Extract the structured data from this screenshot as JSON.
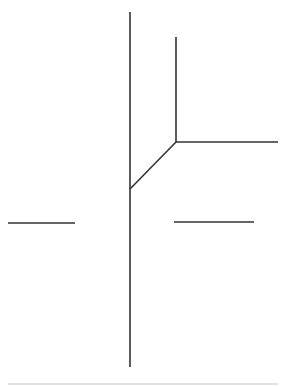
{
  "diagram": {
    "stroke_color": "#333333",
    "baseline_color": "#d8d8d8",
    "segments": [
      {
        "name": "main-vertical-line",
        "x1": 130,
        "y1": 12,
        "x2": 130,
        "y2": 367
      },
      {
        "name": "upper-vertical-line",
        "x1": 176,
        "y1": 37,
        "x2": 176,
        "y2": 142
      },
      {
        "name": "upper-horizontal-line",
        "x1": 176,
        "y1": 142,
        "x2": 278,
        "y2": 142
      },
      {
        "name": "diagonal-line",
        "x1": 176,
        "y1": 142,
        "x2": 130,
        "y2": 189
      },
      {
        "name": "left-horizontal-line",
        "x1": 8,
        "y1": 223,
        "x2": 75,
        "y2": 223
      },
      {
        "name": "right-horizontal-line",
        "x1": 174,
        "y1": 222,
        "x2": 254,
        "y2": 222
      }
    ],
    "baseline": {
      "name": "bottom-baseline",
      "x1": 8,
      "y1": 384,
      "x2": 278,
      "y2": 384
    }
  }
}
